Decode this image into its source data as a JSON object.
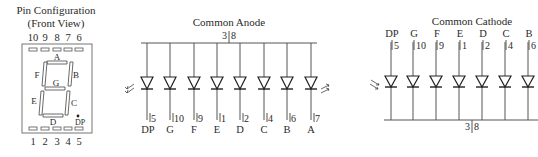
{
  "pin_config": {
    "title_line1": "Pin Configuration",
    "title_line2": "(Front View)",
    "top_pins": [
      "10",
      "9",
      "8",
      "7",
      "6"
    ],
    "bottom_pins": [
      "1",
      "2",
      "3",
      "4",
      "5"
    ],
    "segments": {
      "a": "A",
      "b": "B",
      "c": "C",
      "d": "D",
      "e": "E",
      "f": "F",
      "g": "G",
      "dp": "DP"
    }
  },
  "common_anode": {
    "title": "Common Anode",
    "common_pins": {
      "left": "3",
      "right": "8"
    },
    "leds": [
      {
        "segment": "DP",
        "pin": "5"
      },
      {
        "segment": "G",
        "pin": "10"
      },
      {
        "segment": "F",
        "pin": "9"
      },
      {
        "segment": "E",
        "pin": "1"
      },
      {
        "segment": "D",
        "pin": "2"
      },
      {
        "segment": "C",
        "pin": "4"
      },
      {
        "segment": "B",
        "pin": "6"
      },
      {
        "segment": "A",
        "pin": "7"
      }
    ]
  },
  "common_cathode": {
    "title": "Common Cathode",
    "common_pins": {
      "left": "3",
      "right": "8"
    },
    "leds": [
      {
        "segment": "DP",
        "pin": "5"
      },
      {
        "segment": "G",
        "pin": "10"
      },
      {
        "segment": "F",
        "pin": "9"
      },
      {
        "segment": "E",
        "pin": "1"
      },
      {
        "segment": "D",
        "pin": "2"
      },
      {
        "segment": "C",
        "pin": "4"
      },
      {
        "segment": "B",
        "pin": "6"
      }
    ]
  }
}
